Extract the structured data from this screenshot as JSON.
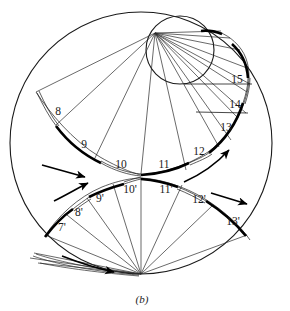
{
  "figure": {
    "caption": "(b)",
    "kind": "geometric-diagram",
    "colors": {
      "ink": "#1a1a1a",
      "background": "#ffffff",
      "thick_arc": "#000000",
      "thin_line": "#2a2a2a"
    },
    "geometry": {
      "outer_circle": {
        "cx": 141,
        "cy": 143,
        "r": 131
      },
      "inner_circle": {
        "cx": 180,
        "cy": 50,
        "r": 34
      },
      "upper_pole": {
        "x": 155,
        "y": 33
      },
      "lower_pole": {
        "x": 141,
        "y": 274
      }
    }
  },
  "labels": {
    "upper": [
      {
        "text": "8",
        "x": 58,
        "y": 112
      },
      {
        "text": "9",
        "x": 84,
        "y": 145
      },
      {
        "text": "10",
        "x": 121,
        "y": 165
      },
      {
        "text": "11",
        "x": 164,
        "y": 165
      },
      {
        "text": "12",
        "x": 199,
        "y": 152
      },
      {
        "text": "13",
        "x": 226,
        "y": 128
      },
      {
        "text": "14",
        "x": 235,
        "y": 105
      },
      {
        "text": "15",
        "x": 237,
        "y": 80
      }
    ],
    "lower": [
      {
        "text": "7'",
        "x": 62,
        "y": 228
      },
      {
        "text": "8'",
        "x": 79,
        "y": 213
      },
      {
        "text": "9'",
        "x": 100,
        "y": 199
      },
      {
        "text": "10'",
        "x": 130,
        "y": 190
      },
      {
        "text": "11'",
        "x": 166,
        "y": 190
      },
      {
        "text": "12'",
        "x": 199,
        "y": 200
      },
      {
        "text": "13'",
        "x": 233,
        "y": 222
      }
    ]
  },
  "arrows": [
    {
      "name": "arrow-upper-left",
      "x1": 42,
      "y1": 164,
      "x2": 86,
      "y2": 175,
      "curved": false
    },
    {
      "name": "arrow-lower-left",
      "x1": 54,
      "y1": 200,
      "x2": 88,
      "y2": 183,
      "curved": true
    },
    {
      "name": "arrow-upper-right",
      "x1": 184,
      "y1": 180,
      "x2": 229,
      "y2": 149,
      "curved": true
    },
    {
      "name": "arrow-lower-right",
      "x1": 211,
      "y1": 193,
      "x2": 248,
      "y2": 203,
      "curved": false
    },
    {
      "name": "arrow-bottom-left",
      "x1": 62,
      "y1": 256,
      "x2": 116,
      "y2": 271,
      "curved": true
    }
  ]
}
